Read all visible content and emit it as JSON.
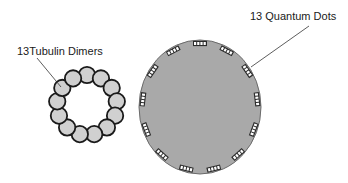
{
  "labels": {
    "tubulin": "13Tubulin Dimers",
    "quantum_dots": "13 Quantum Dots"
  },
  "tubulin_ring": {
    "count": 13,
    "center": [
      87,
      105
    ],
    "ring_radius": 30,
    "bead_radius": 8.2,
    "bead_fill": "#d0d0d0",
    "bead_stroke": "#1a1a1a"
  },
  "nanoparticle": {
    "center": [
      200,
      107
    ],
    "rx": 61,
    "ry": 67,
    "fill": "#a9a9a9",
    "stroke": "#6b6b6b",
    "quantum_dot_count": 13,
    "dot_fill": "#ffffff",
    "dot_stroke": "#1a1a1a"
  },
  "leaders": {
    "tubulin": {
      "from": [
        37,
        58
      ],
      "to": [
        61,
        87
      ]
    },
    "quantum_dots": {
      "from": [
        309,
        26
      ],
      "to": [
        251,
        67
      ]
    }
  }
}
